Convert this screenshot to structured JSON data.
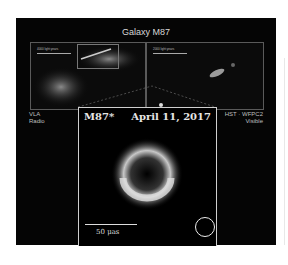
{
  "figure": {
    "title": "Galaxy M87",
    "left_inset": {
      "scale_label": "4000 light years",
      "scale_label_verified": false,
      "instrument": "VLA",
      "band": "Radio"
    },
    "right_inset": {
      "scale_label": "2000 light years",
      "scale_label_verified": false,
      "instrument": "HST · WFPC2",
      "band": "Visible"
    },
    "center": {
      "object": "M87*",
      "date": "April 11, 2017",
      "scale_bar": "50 μas",
      "beam_icon": "circle-outline"
    },
    "colors": {
      "background": "#050505",
      "text": "#d8d8d8",
      "frame": "#cfcfcf"
    }
  }
}
